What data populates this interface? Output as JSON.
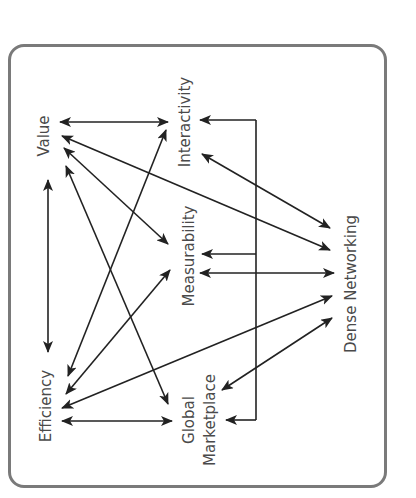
{
  "diagram": {
    "type": "concept-network",
    "orientation": "rotated-90-ccw",
    "frame": {
      "stroke": "#7a7a7a",
      "style": "rounded-rectangle"
    },
    "colors": {
      "arrow": "#222222",
      "label": "#4a4a4a"
    },
    "nodes": [
      {
        "id": "value",
        "label": "Value"
      },
      {
        "id": "interactivity",
        "label": "Interactivity"
      },
      {
        "id": "measurability",
        "label": "Measurability"
      },
      {
        "id": "dense_networking",
        "label": "Dense Networking"
      },
      {
        "id": "efficiency",
        "label": "Efficiency"
      },
      {
        "id": "global_marketplace",
        "label_line1": "Global",
        "label_line2": "Marketplace"
      }
    ],
    "edges": [
      {
        "from": "value",
        "to": "interactivity",
        "direction": "both"
      },
      {
        "from": "value",
        "to": "efficiency",
        "direction": "both"
      },
      {
        "from": "value",
        "to": "dense_networking",
        "direction": "both"
      },
      {
        "from": "value",
        "to": "measurability",
        "direction": "both"
      },
      {
        "from": "value",
        "to": "global_marketplace",
        "direction": "both"
      },
      {
        "from": "efficiency",
        "to": "interactivity",
        "direction": "both"
      },
      {
        "from": "efficiency",
        "to": "measurability",
        "direction": "both"
      },
      {
        "from": "efficiency",
        "to": "dense_networking",
        "direction": "both"
      },
      {
        "from": "efficiency",
        "to": "global_marketplace",
        "direction": "both"
      },
      {
        "from": "interactivity",
        "to": "dense_networking",
        "direction": "both"
      },
      {
        "from": "measurability",
        "to": "dense_networking",
        "direction": "both"
      },
      {
        "from": "global_marketplace",
        "to": "dense_networking",
        "direction": "both"
      },
      {
        "from": "bracket",
        "to": [
          "interactivity",
          "measurability",
          "global_marketplace"
        ],
        "direction": "fan-out"
      }
    ]
  }
}
